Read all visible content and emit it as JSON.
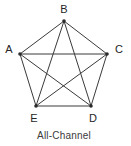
{
  "figure": {
    "caption": "All-Channel",
    "caption_x": 64,
    "caption_y": 136,
    "background_color": "#ffffff",
    "edge_color": "#3a3a3a",
    "node_color": "#2b2b2b",
    "label_color": "#262626"
  },
  "chart_data": {
    "type": "diagram",
    "diagram_type": "network-graph",
    "title": "All-Channel",
    "node_count": 5,
    "edge_count": 10,
    "nodes": [
      {
        "id": "A",
        "label": "A",
        "x": 20,
        "y": 54,
        "label_x": 9,
        "label_y": 50
      },
      {
        "id": "B",
        "label": "B",
        "x": 64,
        "y": 21,
        "label_x": 64,
        "label_y": 10
      },
      {
        "id": "C",
        "label": "C",
        "x": 107,
        "y": 54,
        "label_x": 119,
        "label_y": 50
      },
      {
        "id": "D",
        "label": "D",
        "x": 91,
        "y": 106,
        "label_x": 93,
        "label_y": 119
      },
      {
        "id": "E",
        "label": "E",
        "x": 36,
        "y": 106,
        "label_x": 34,
        "label_y": 119
      }
    ],
    "edges": [
      {
        "from": "A",
        "to": "B",
        "kind": "perimeter"
      },
      {
        "from": "B",
        "to": "C",
        "kind": "perimeter"
      },
      {
        "from": "C",
        "to": "D",
        "kind": "perimeter"
      },
      {
        "from": "D",
        "to": "E",
        "kind": "perimeter"
      },
      {
        "from": "E",
        "to": "A",
        "kind": "perimeter"
      },
      {
        "from": "A",
        "to": "C",
        "kind": "diagonal"
      },
      {
        "from": "A",
        "to": "D",
        "kind": "diagonal"
      },
      {
        "from": "B",
        "to": "D",
        "kind": "diagonal"
      },
      {
        "from": "B",
        "to": "E",
        "kind": "diagonal"
      },
      {
        "from": "C",
        "to": "E",
        "kind": "diagonal"
      }
    ]
  }
}
